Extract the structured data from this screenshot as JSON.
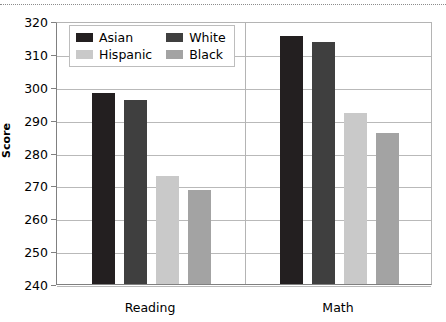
{
  "chart_data": {
    "type": "bar",
    "title": "",
    "xlabel": "",
    "ylabel": "Score",
    "categories": [
      "Reading",
      "Math"
    ],
    "series": [
      {
        "name": "Asian",
        "color": "#231f20",
        "values": [
          298,
          315.5
        ]
      },
      {
        "name": "White",
        "color": "#3f3f3f",
        "values": [
          296,
          313.5
        ]
      },
      {
        "name": "Hispanic",
        "color": "#c9c9c9",
        "values": [
          273,
          292
        ]
      },
      {
        "name": "Black",
        "color": "#a3a3a3",
        "values": [
          268.5,
          286
        ]
      }
    ],
    "ylim": [
      240,
      320
    ],
    "ytick_step": 10,
    "yticks": [
      "320",
      "310",
      "300",
      "290",
      "280",
      "270",
      "260",
      "250",
      "240"
    ],
    "grid": true,
    "legend_position": "top-left-inside",
    "legend_layout": "2x2"
  },
  "axis": {
    "y_title": "Score"
  },
  "legend": {
    "entries": [
      {
        "label": "Asian"
      },
      {
        "label": "White"
      },
      {
        "label": "Hispanic"
      },
      {
        "label": "Black"
      }
    ]
  }
}
